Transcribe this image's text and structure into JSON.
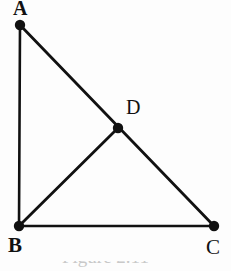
{
  "figure": {
    "background_color": "#fdfdfd",
    "ink_color": "#111111",
    "caption": "Figure 2.11",
    "shape_description": "right triangle ABC with median BD to hypotenuse AC",
    "points": [
      {
        "id": "A",
        "label": "A",
        "x": 20,
        "y": 25,
        "dot_radius": 5.2
      },
      {
        "id": "B",
        "label": "B",
        "x": 19,
        "y": 226,
        "dot_radius": 5.2
      },
      {
        "id": "C",
        "label": "C",
        "x": 214,
        "y": 226,
        "dot_radius": 5.2
      },
      {
        "id": "D",
        "label": "D",
        "x": 118,
        "y": 128,
        "dot_radius": 5.2
      }
    ],
    "segments": [
      {
        "id": "AB",
        "from": "A",
        "to": "B",
        "width": 2.6
      },
      {
        "id": "BC",
        "from": "B",
        "to": "C",
        "width": 2.6
      },
      {
        "id": "AC",
        "from": "A",
        "to": "C",
        "width": 2.8
      },
      {
        "id": "BD",
        "from": "B",
        "to": "D",
        "width": 2.8
      }
    ],
    "labels": {
      "A": "A",
      "B": "B",
      "C": "C",
      "D": "D"
    }
  }
}
